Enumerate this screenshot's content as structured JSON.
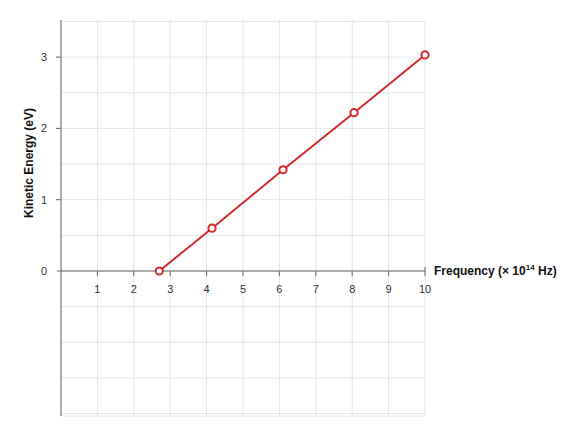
{
  "chart_data": {
    "type": "line",
    "title": "",
    "xlabel": "Frequency (× 10¹⁴ Hz)",
    "ylabel": "Kinetic Energy  (eV)",
    "x_ticks": [
      "1",
      "2",
      "3",
      "4",
      "5",
      "6",
      "7",
      "8",
      "9",
      "10"
    ],
    "y_ticks": [
      "0",
      "1",
      "2",
      "3"
    ],
    "xlim": [
      0,
      10
    ],
    "ylim": [
      -2,
      3.5
    ],
    "grid": true,
    "series": [
      {
        "name": "Kinetic Energy",
        "color": "#d42a2a",
        "marker": "open-circle",
        "x": [
          2.7,
          4.15,
          6.1,
          8.05,
          10.0
        ],
        "y": [
          0.0,
          0.6,
          1.42,
          2.22,
          3.03
        ]
      }
    ]
  },
  "labels": {
    "xlabel_main": "Frequency (× 10",
    "xlabel_exp": "14",
    "xlabel_tail": " Hz)",
    "ylabel": "Kinetic Energy  (eV)"
  }
}
